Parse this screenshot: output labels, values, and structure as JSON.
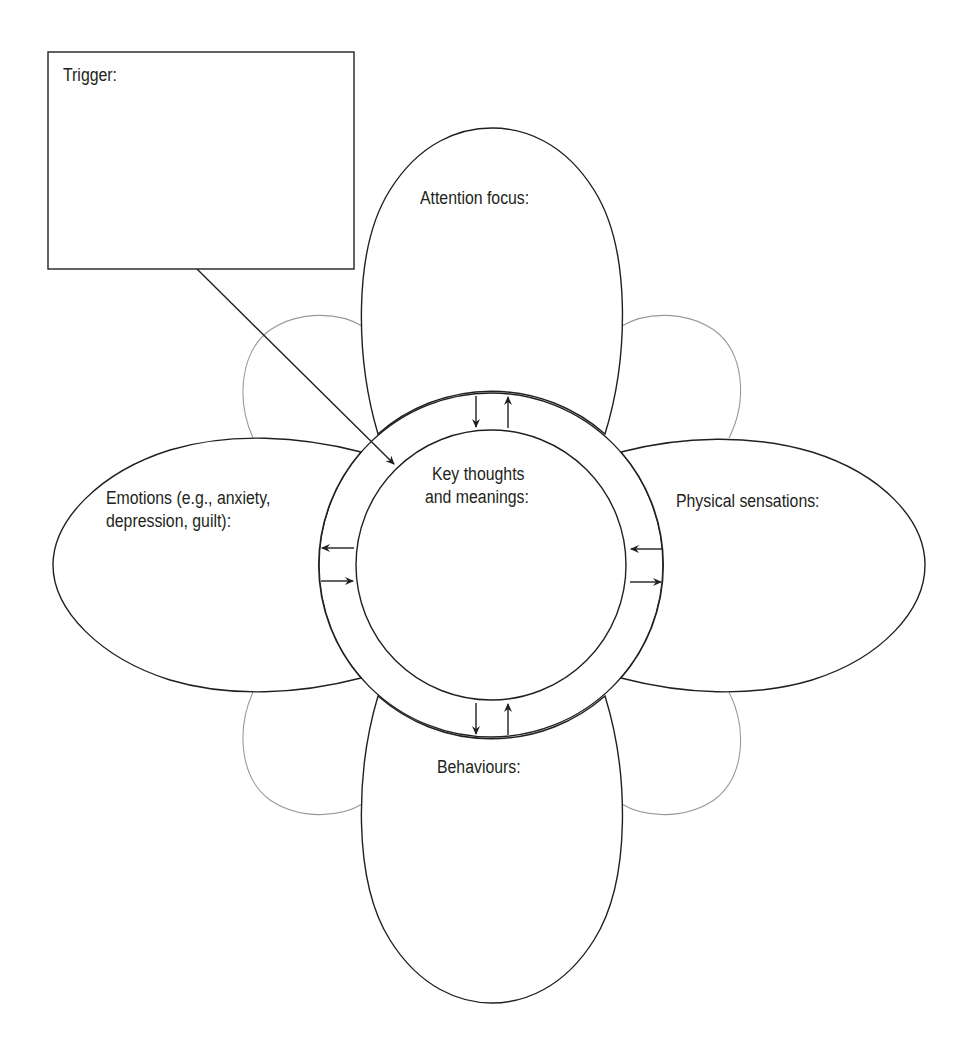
{
  "diagram": {
    "type": "CBT five-areas flower worksheet",
    "trigger": {
      "label": "Trigger:"
    },
    "center": {
      "label_line1": "Key thoughts",
      "label_line2": "and meanings:"
    },
    "petals": {
      "top": {
        "label": "Attention focus:"
      },
      "left": {
        "label_line1": "Emotions (e.g., anxiety,",
        "label_line2": "depression, guilt):"
      },
      "right": {
        "label": "Physical sensations:"
      },
      "bottom": {
        "label": "Behaviours:"
      }
    },
    "arrows": {
      "top": [
        "down",
        "up"
      ],
      "left": [
        "left",
        "right"
      ],
      "right": [
        "left",
        "right"
      ],
      "bottom": [
        "down",
        "up"
      ]
    },
    "colors": {
      "stroke": "#231f20",
      "ghost_petals": "#9a9a9a",
      "background": "#ffffff"
    }
  }
}
